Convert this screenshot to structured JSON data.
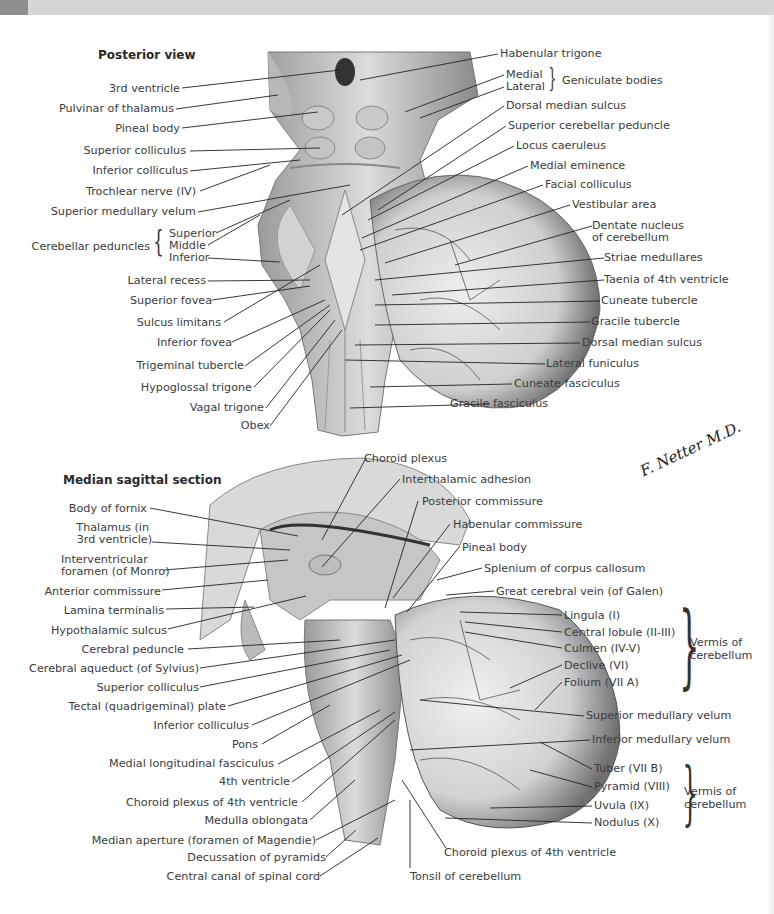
{
  "header": {
    "bar_color": "#d6d6d6",
    "tab_color": "#8f8f8f"
  },
  "posterior": {
    "title": "Posterior view",
    "left_labels": [
      "3rd ventricle",
      "Pulvinar of thalamus",
      "Pineal body",
      "Superior colliculus",
      "Inferior colliculus",
      "Trochlear nerve (IV)",
      "Superior medullary velum"
    ],
    "peduncles": {
      "group": "Cerebellar peduncles",
      "items": [
        "Superior",
        "Middle",
        "Inferior"
      ]
    },
    "left_labels_lower": [
      "Lateral recess",
      "Superior fovea",
      "Sulcus limitans",
      "Inferior fovea",
      "Trigeminal tubercle",
      "Hypoglossal trigone",
      "Vagal trigone",
      "Obex"
    ],
    "right_labels_top": [
      "Habenular trigone"
    ],
    "geniculate": {
      "group": "Geniculate bodies",
      "items": [
        "Medial",
        "Lateral"
      ]
    },
    "right_labels": [
      "Dorsal median sulcus",
      "Superior cerebellar peduncle",
      "Locus caeruleus",
      "Medial eminence",
      "Facial colliculus",
      "Vestibular area",
      "Dentate nucleus",
      "of cerebellum",
      "Striae medullares",
      "Taenia of 4th ventricle",
      "Cuneate tubercle",
      "Gracile tubercle",
      "Dorsal median sulcus",
      "Lateral funiculus",
      "Cuneate fasciculus",
      "Gracile fasciculus"
    ]
  },
  "signature": "F. Netter M.D.",
  "sagittal": {
    "title": "Median sagittal section",
    "left_labels": [
      "Body of fornix",
      "Thalamus (in",
      "3rd ventricle)",
      "Interventricular",
      "foramen (of Monro)",
      "Anterior commissure",
      "Lamina terminalis",
      "Hypothalamic sulcus",
      "Cerebral peduncle",
      "Cerebral aqueduct (of Sylvius)",
      "Superior colliculus",
      "Tectal (quadrigeminal) plate",
      "Inferior colliculus",
      "Pons",
      "Medial longitudinal fasciculus",
      "4th ventricle",
      "Choroid plexus of 4th ventricle",
      "Medulla oblongata",
      "Median aperture (foramen of Magendie)",
      "Decussation of pyramids",
      "Central canal of spinal cord"
    ],
    "top_labels": [
      "Choroid plexus",
      "Interthalamic adhesion",
      "Posterior commissure",
      "Habenular commissure",
      "Pineal body",
      "Splenium of corpus callosum",
      "Great cerebral vein (of Galen)"
    ],
    "vermis_upper": {
      "group": "Vermis of cerebellum",
      "items": [
        "Lingula (I)",
        "Central lobule (II-III)",
        "Culmen (IV-V)",
        "Declive (VI)",
        "Folium (VII A)"
      ]
    },
    "mid_labels": [
      "Superior medullary velum",
      "Inferior medullary velum"
    ],
    "vermis_lower": {
      "group": "Vermis of cerebellum",
      "items": [
        "Tuber (VII B)",
        "Pyramid (VIII)",
        "Uvula (IX)",
        "Nodulus (X)"
      ]
    },
    "bottom_labels": [
      "Choroid plexus of 4th ventricle",
      "Tonsil of cerebellum"
    ]
  }
}
